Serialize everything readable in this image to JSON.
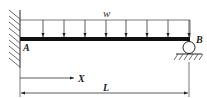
{
  "diagram": {
    "type": "propped-cantilever-beam",
    "labels": {
      "load": "w",
      "fixed_end": "A",
      "roller_end": "B",
      "position": "X",
      "length": "L"
    },
    "load_arrow_count": 8,
    "colors": {
      "ink": "#222222",
      "beam": "#111111",
      "background": "#ffffff"
    }
  }
}
